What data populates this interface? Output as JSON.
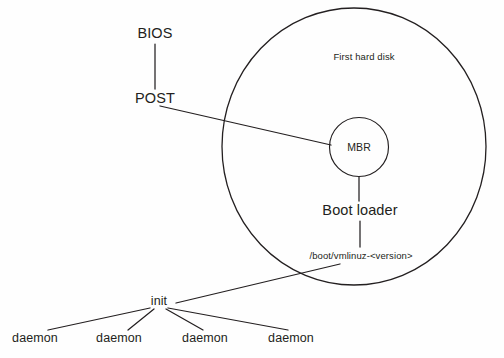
{
  "diagram": {
    "background_color": "#fefefe",
    "stroke_color": "#231f20",
    "nodes": {
      "bios": {
        "label": "BIOS",
        "x": 155,
        "y": 34
      },
      "post": {
        "label": "POST",
        "x": 155,
        "y": 99
      },
      "first_hard_disk": {
        "label": "First hard disk",
        "x": 364,
        "y": 57
      },
      "mbr": {
        "label": "MBR",
        "x": 359,
        "y": 148
      },
      "boot_loader": {
        "label": "Boot loader",
        "x": 360,
        "y": 211
      },
      "kernel_path": {
        "label": "/boot/vmlinuz-<version>",
        "x": 361,
        "y": 256
      },
      "init": {
        "label": "init",
        "x": 159,
        "y": 302
      },
      "daemons": [
        {
          "label": "daemon",
          "x": 35,
          "y": 339
        },
        {
          "label": "daemon",
          "x": 119,
          "y": 339
        },
        {
          "label": "daemon",
          "x": 205,
          "y": 339
        },
        {
          "label": "daemon",
          "x": 291,
          "y": 339
        }
      ]
    },
    "shapes": {
      "disk_circle": {
        "cx": 354,
        "cy": 146.5,
        "rx": 132,
        "ry": 138.5
      },
      "mbr_circle": {
        "cx": 359,
        "cy": 147,
        "r": 29.5
      }
    },
    "edges": [
      {
        "from": "bios",
        "to": "post"
      },
      {
        "from": "post",
        "to": "mbr"
      },
      {
        "from": "mbr",
        "to": "boot_loader"
      },
      {
        "from": "boot_loader",
        "to": "kernel_path"
      },
      {
        "from": "kernel_path",
        "to": "init"
      },
      {
        "from": "init",
        "to": "daemon-1"
      },
      {
        "from": "init",
        "to": "daemon-2"
      },
      {
        "from": "init",
        "to": "daemon-3"
      },
      {
        "from": "init",
        "to": "daemon-4"
      }
    ]
  }
}
